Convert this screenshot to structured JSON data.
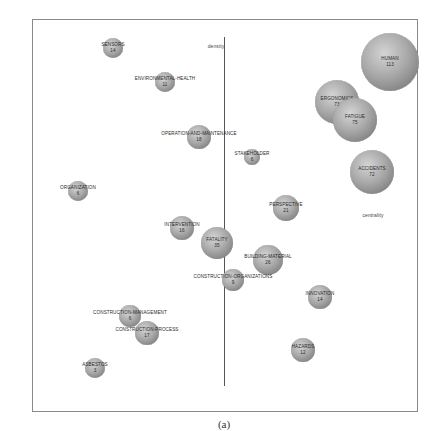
{
  "chart_data": {
    "type": "scatter",
    "subtype": "bubble-strategic-diagram",
    "title": "",
    "caption": "(a)",
    "xlabel": "centrality",
    "ylabel": "density",
    "grid": false,
    "legend": null,
    "axis_lines": {
      "vertical": true,
      "horizontal": false
    },
    "points": [
      {
        "label": "HUMAN",
        "value": 113,
        "x": 390,
        "y": 62,
        "r": 29
      },
      {
        "label": "ERGONOMICS",
        "value": 73,
        "x": 337,
        "y": 102,
        "r": 22
      },
      {
        "label": "FATIGUE",
        "value": 75,
        "x": 355,
        "y": 120,
        "r": 22
      },
      {
        "label": "ACCIDENTS",
        "value": 72,
        "x": 372,
        "y": 172,
        "r": 22
      },
      {
        "label": "SENSORS",
        "value": 14,
        "x": 113,
        "y": 48,
        "r": 10
      },
      {
        "label": "ENVIRONMENTAL-HEALTH",
        "value": 11,
        "x": 165,
        "y": 82,
        "r": 10
      },
      {
        "label": "OPERATION-AND-MAINTENANCE",
        "value": 18,
        "x": 199,
        "y": 137,
        "r": 12
      },
      {
        "label": "STAKEHOLDER",
        "value": 6,
        "x": 252,
        "y": 157,
        "r": 8
      },
      {
        "label": "ORGANIZATION",
        "value": 6,
        "x": 78,
        "y": 191,
        "r": 10
      },
      {
        "label": "PERSPECTIVE",
        "value": 21,
        "x": 286,
        "y": 208,
        "r": 13
      },
      {
        "label": "INTERVENTION",
        "value": 16,
        "x": 182,
        "y": 228,
        "r": 12
      },
      {
        "label": "FATALITY",
        "value": 35,
        "x": 217,
        "y": 243,
        "r": 16
      },
      {
        "label": "BUILDING-MATERIAL",
        "value": 26,
        "x": 268,
        "y": 260,
        "r": 15
      },
      {
        "label": "CONSTRUCTION-ORGANIZATIONS",
        "value": 9,
        "x": 233,
        "y": 280,
        "r": 11
      },
      {
        "label": "INNOVATION",
        "value": 14,
        "x": 320,
        "y": 297,
        "r": 12
      },
      {
        "label": "CONSTRUCTION-MANAGEMENT",
        "value": 6,
        "x": 130,
        "y": 316,
        "r": 11
      },
      {
        "label": "CONSTRUCTION-PROCESS",
        "value": 17,
        "x": 147,
        "y": 333,
        "r": 12
      },
      {
        "label": "HAZARDS",
        "value": 12,
        "x": 303,
        "y": 350,
        "r": 12
      },
      {
        "label": "ASBESTOS",
        "value": 3,
        "x": 95,
        "y": 368,
        "r": 10
      }
    ],
    "axis_label_positions": {
      "density": {
        "x": 216,
        "y": 46
      },
      "centrality": {
        "x": 373,
        "y": 215
      }
    }
  }
}
